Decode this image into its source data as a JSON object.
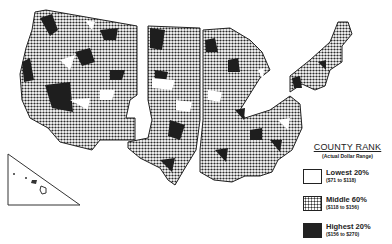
{
  "map": {
    "type": "choropleth",
    "subject": "United States counties",
    "inset": "Hawaii"
  },
  "legend": {
    "title": "COUNTY RANK",
    "subtitle": "(Actual Dollar Range)",
    "items": [
      {
        "label": "Lowest 20%",
        "range": "($71 to $118)",
        "fill": "white"
      },
      {
        "label": "Middle 60%",
        "range": "($118 to $156)",
        "fill": "dotted"
      },
      {
        "label": "Highest 20%",
        "range": "($156 to $270)",
        "fill": "black"
      }
    ]
  },
  "colors": {
    "low": "#ffffff",
    "middle": "#7a7a7a",
    "high": "#1e1e1e",
    "outline": "#222222"
  }
}
